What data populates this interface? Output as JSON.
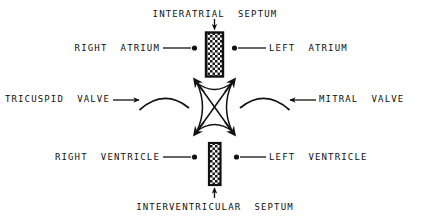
{
  "diagram": {
    "background_color": "#ffffff",
    "ink_color": "#111111",
    "labels": {
      "interatrial_septum": "INTERATRIAL  SEPTUM",
      "interventricular_septum": "INTERVENTRICULAR  SEPTUM",
      "right_atrium": "RIGHT  ATRIUM",
      "left_atrium": "LEFT  ATRIUM",
      "right_ventricle": "RIGHT  VENTRICLE",
      "left_ventricle": "LEFT  VENTRICLE",
      "tricuspid_valve": "TRICUSPID  VALVE",
      "mitral_valve": "MITRAL  VALVE"
    },
    "parts": {
      "upper_septum": "interatrial-septum-block",
      "lower_septum": "interventricular-septum-block",
      "valve_ring": "atrioventricular-valve-ring",
      "tricuspid_arc": "tricuspid-valve-arc",
      "mitral_arc": "mitral-valve-arc"
    }
  }
}
